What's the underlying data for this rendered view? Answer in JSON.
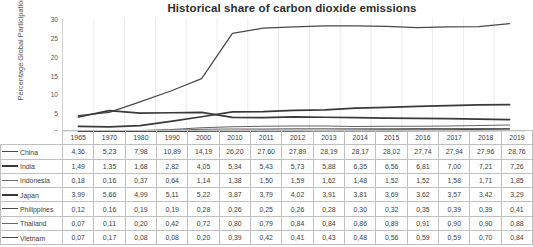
{
  "chart_data": {
    "type": "line",
    "title": "Historical share of carbon dioxide emissions",
    "xlabel": "",
    "ylabel": "Percentage Global Participation",
    "ylim": [
      0,
      30
    ],
    "yticks": [
      "0",
      "5",
      "10",
      "15",
      "20",
      "25",
      "30"
    ],
    "grid": true,
    "legend_position": "left-table",
    "categories": [
      "1965",
      "1970",
      "1980",
      "1990",
      "2000",
      "2010",
      "2011",
      "2012",
      "2013",
      "2014",
      "2015",
      "2016",
      "2017",
      "2018",
      "2019"
    ],
    "series": [
      {
        "name": "China",
        "values": [
          4.36,
          5.23,
          7.98,
          10.89,
          14.19,
          26.2,
          27.6,
          27.89,
          28.19,
          28.17,
          28.02,
          27.74,
          27.94,
          27.96,
          28.76
        ]
      },
      {
        "name": "India",
        "values": [
          1.49,
          1.35,
          1.68,
          2.82,
          4.05,
          5.34,
          5.43,
          5.73,
          5.88,
          6.35,
          6.56,
          6.81,
          7.0,
          7.21,
          7.26
        ]
      },
      {
        "name": "Indonesia",
        "values": [
          0.18,
          0.16,
          0.37,
          0.64,
          1.14,
          1.38,
          1.5,
          1.59,
          1.62,
          1.48,
          1.52,
          1.52,
          1.58,
          1.71,
          1.85
        ]
      },
      {
        "name": "Japan",
        "values": [
          3.99,
          5.66,
          4.99,
          5.11,
          5.22,
          3.87,
          3.79,
          4.02,
          3.91,
          3.81,
          3.69,
          3.62,
          3.57,
          3.42,
          3.29
        ]
      },
      {
        "name": "Philippines",
        "values": [
          0.12,
          0.16,
          0.19,
          0.19,
          0.28,
          0.26,
          0.25,
          0.26,
          0.28,
          0.3,
          0.32,
          0.35,
          0.39,
          0.39,
          0.41
        ]
      },
      {
        "name": "Thailand",
        "values": [
          0.07,
          0.11,
          0.2,
          0.42,
          0.72,
          0.8,
          0.79,
          0.84,
          0.84,
          0.86,
          0.89,
          0.91,
          0.9,
          0.9,
          0.88
        ]
      },
      {
        "name": "Vietnam",
        "values": [
          0.07,
          0.17,
          0.08,
          0.08,
          0.2,
          0.39,
          0.42,
          0.41,
          0.43,
          0.48,
          0.56,
          0.59,
          0.59,
          0.7,
          0.84
        ]
      }
    ]
  },
  "table": {
    "corner_label": "",
    "headers": [
      "1965",
      "1970",
      "1980",
      "1990",
      "2000",
      "2010",
      "2011",
      "2012",
      "2013",
      "2014",
      "2015",
      "2016",
      "2017",
      "2018",
      "2019"
    ],
    "rows": [
      {
        "label": "China",
        "cells": [
          "4,36",
          "5,23",
          "7,98",
          "10,89",
          "14,19",
          "26,20",
          "27,60",
          "27,89",
          "28,19",
          "28,17",
          "28,02",
          "27,74",
          "27,94",
          "27,96",
          "28,76"
        ]
      },
      {
        "label": "India",
        "cells": [
          "1,49",
          "1,35",
          "1,68",
          "2,82",
          "4,05",
          "5,34",
          "5,43",
          "5,73",
          "5,88",
          "6,35",
          "6,56",
          "6,81",
          "7,00",
          "7,21",
          "7,26"
        ]
      },
      {
        "label": "Indonesia",
        "cells": [
          "0,18",
          "0,16",
          "0,37",
          "0,64",
          "1,14",
          "1,38",
          "1,50",
          "1,59",
          "1,62",
          "1,48",
          "1,52",
          "1,52",
          "1,58",
          "1,71",
          "1,85"
        ]
      },
      {
        "label": "Japan",
        "cells": [
          "3,99",
          "5,66",
          "4,99",
          "5,11",
          "5,22",
          "3,87",
          "3,79",
          "4,02",
          "3,91",
          "3,81",
          "3,69",
          "3,62",
          "3,57",
          "3,42",
          "3,29"
        ]
      },
      {
        "label": "Philippines",
        "cells": [
          "0,12",
          "0,16",
          "0,19",
          "0,19",
          "0,28",
          "0,26",
          "0,25",
          "0,26",
          "0,28",
          "0,30",
          "0,32",
          "0,35",
          "0,39",
          "0,39",
          "0,41"
        ]
      },
      {
        "label": "Thailand",
        "cells": [
          "0,07",
          "0,11",
          "0,20",
          "0,42",
          "0,72",
          "0,80",
          "0,79",
          "0,84",
          "0,84",
          "0,86",
          "0,89",
          "0,91",
          "0,90",
          "0,90",
          "0,88"
        ]
      },
      {
        "label": "Vietnam",
        "cells": [
          "0,07",
          "0,17",
          "0,08",
          "0,08",
          "0,20",
          "0,39",
          "0,42",
          "0,41",
          "0,43",
          "0,48",
          "0,56",
          "0,59",
          "0,59",
          "0,70",
          "0,84"
        ]
      }
    ]
  },
  "colors": {
    "line": "#4a4a4a",
    "grid": "#e2e2e2",
    "border": "#c0c0c0",
    "text": "#3d3d3d"
  }
}
